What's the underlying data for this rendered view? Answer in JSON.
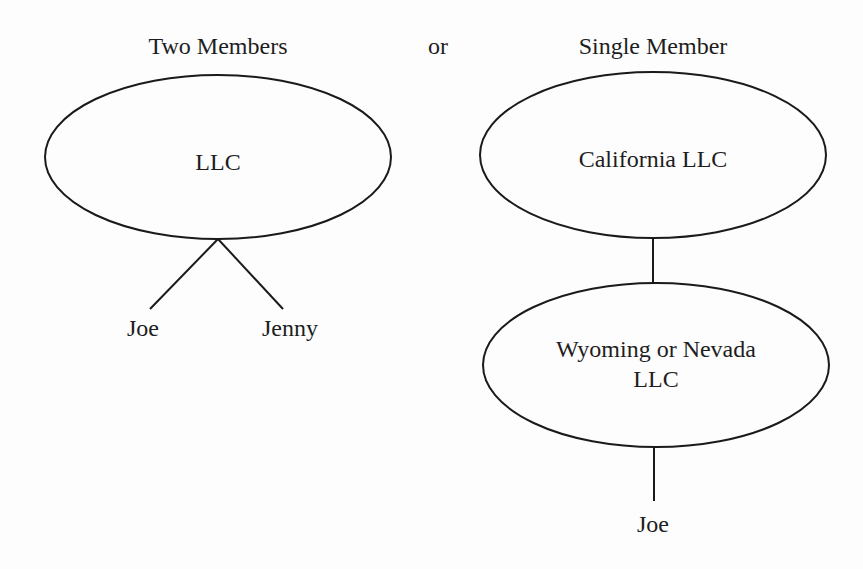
{
  "header": {
    "left_title": "Two Members",
    "separator": "or",
    "right_title": "Single Member"
  },
  "two_member": {
    "entity": "LLC",
    "members": [
      "Joe",
      "Jenny"
    ]
  },
  "single_member": {
    "parent_entity": "California LLC",
    "child_entity_line1": "Wyoming or Nevada",
    "child_entity_line2": "LLC",
    "member": "Joe"
  },
  "colors": {
    "stroke": "#1a1a1a",
    "text": "#1e1e1e",
    "background": "#fdfdfd"
  }
}
